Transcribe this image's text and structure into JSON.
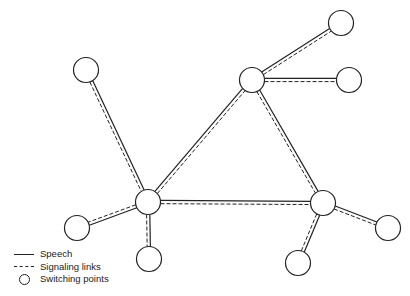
{
  "diagram": {
    "nodes": [
      {
        "id": "n1",
        "x": 86,
        "y": 70
      },
      {
        "id": "n2",
        "x": 148,
        "y": 202
      },
      {
        "id": "n3",
        "x": 77,
        "y": 228
      },
      {
        "id": "n4",
        "x": 149,
        "y": 259
      },
      {
        "id": "n5",
        "x": 252,
        "y": 80
      },
      {
        "id": "n6",
        "x": 341,
        "y": 23
      },
      {
        "id": "n7",
        "x": 349,
        "y": 80
      },
      {
        "id": "n8",
        "x": 323,
        "y": 203
      },
      {
        "id": "n9",
        "x": 388,
        "y": 228
      },
      {
        "id": "n10",
        "x": 298,
        "y": 263
      }
    ],
    "links": [
      [
        "n1",
        "n2"
      ],
      [
        "n2",
        "n3"
      ],
      [
        "n2",
        "n4"
      ],
      [
        "n2",
        "n5"
      ],
      [
        "n2",
        "n8"
      ],
      [
        "n5",
        "n6"
      ],
      [
        "n5",
        "n7"
      ],
      [
        "n5",
        "n8"
      ],
      [
        "n8",
        "n9"
      ],
      [
        "n8",
        "n10"
      ]
    ]
  },
  "legend": {
    "speech": "Speech",
    "signaling": "Signaling links",
    "switching": "Switching points"
  }
}
